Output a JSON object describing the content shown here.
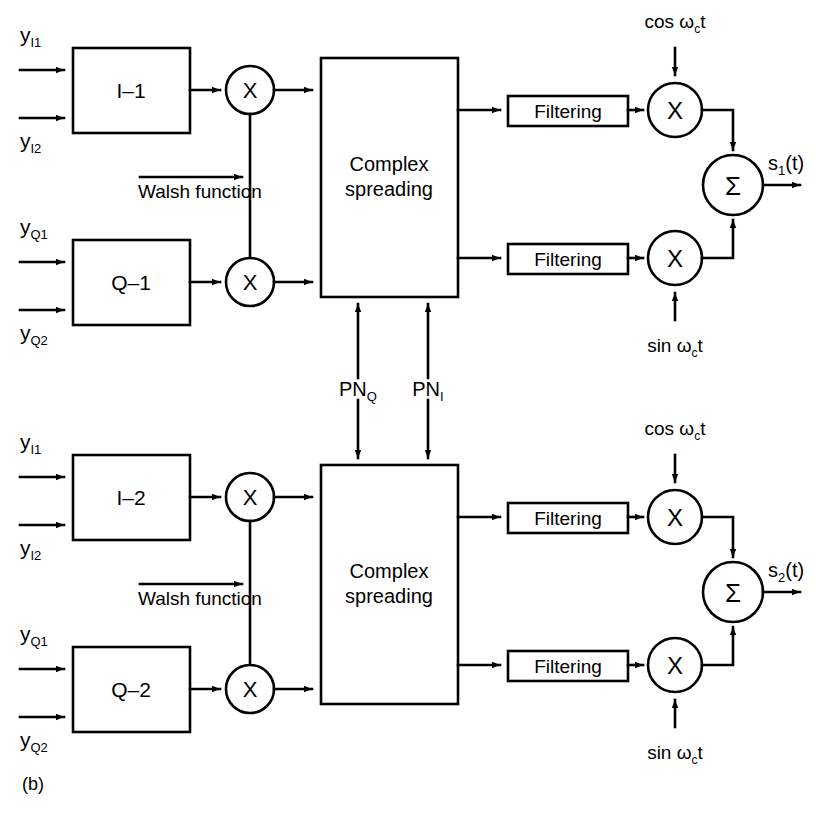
{
  "figure": {
    "caption": "(b)",
    "domain": "communications block diagram",
    "line_color": "#000000",
    "background": "#ffffff"
  },
  "branches": [
    {
      "id": "branch-1",
      "inputs": [
        {
          "name": "y-I1",
          "base": "y",
          "subscript": "I1"
        },
        {
          "name": "y-I2",
          "base": "y",
          "subscript": "I2"
        },
        {
          "name": "y-Q1",
          "base": "y",
          "subscript": "Q1"
        },
        {
          "name": "y-Q2",
          "base": "y",
          "subscript": "Q2"
        }
      ],
      "i_block_label": "I–1",
      "q_block_label": "Q–1",
      "walsh_label": "Walsh function",
      "mult_symbol": "X",
      "spreading_label_line1": "Complex",
      "spreading_label_line2": "spreading",
      "filter_label": "Filtering",
      "carrier_cos": {
        "prefix": "cos ",
        "omega": "ω",
        "subscript": "c",
        "suffix": "t"
      },
      "carrier_sin": {
        "prefix": "sin ",
        "omega": "ω",
        "subscript": "c",
        "suffix": "t"
      },
      "sum_symbol": "Σ",
      "output": {
        "base": "s",
        "subscript": "1",
        "suffix": "(t)"
      }
    },
    {
      "id": "branch-2",
      "inputs": [
        {
          "name": "y-I1",
          "base": "y",
          "subscript": "I1"
        },
        {
          "name": "y-I2",
          "base": "y",
          "subscript": "I2"
        },
        {
          "name": "y-Q1",
          "base": "y",
          "subscript": "Q1"
        },
        {
          "name": "y-Q2",
          "base": "y",
          "subscript": "Q2"
        }
      ],
      "i_block_label": "I–2",
      "q_block_label": "Q–2",
      "walsh_label": "Walsh function",
      "mult_symbol": "X",
      "spreading_label_line1": "Complex",
      "spreading_label_line2": "spreading",
      "filter_label": "Filtering",
      "carrier_cos": {
        "prefix": "cos ",
        "omega": "ω",
        "subscript": "c",
        "suffix": "t"
      },
      "carrier_sin": {
        "prefix": "sin ",
        "omega": "ω",
        "subscript": "c",
        "suffix": "t"
      },
      "sum_symbol": "Σ",
      "output": {
        "base": "s",
        "subscript": "2",
        "suffix": "(t)"
      }
    }
  ],
  "pn_signals": [
    {
      "name": "pn-q",
      "base": "PN",
      "subscript": "Q"
    },
    {
      "name": "pn-i",
      "base": "PN",
      "subscript": "I"
    }
  ],
  "text": {
    "b1_i_label": "I–1",
    "b1_q_label": "Q–1",
    "b2_i_label": "I–2",
    "b2_q_label": "Q–2",
    "complex": "Complex",
    "spreading": "spreading",
    "filtering": "Filtering",
    "walsh": "Walsh function",
    "mult": "X",
    "sum": "Σ",
    "cos_prefix": "cos ",
    "sin_prefix": "sin ",
    "omega": "ω",
    "omega_sub": "c",
    "omega_suffix": "t",
    "y": "y",
    "sub_I1": "I1",
    "sub_I2": "I2",
    "sub_Q1": "Q1",
    "sub_Q2": "Q2",
    "pn": "PN",
    "pn_sub_q": "Q",
    "pn_sub_i": "I",
    "s": "s",
    "s1_sub": "1",
    "s2_sub": "2",
    "s_suffix": "(t)",
    "caption": "(b)"
  }
}
